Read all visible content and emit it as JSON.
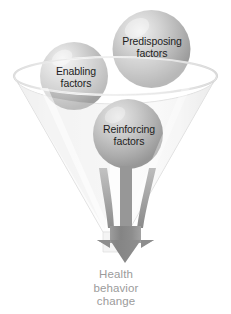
{
  "diagram": {
    "funnel": {
      "name": "funnel",
      "rim_label": "",
      "fill_color": "#f2f2f2",
      "outline_color": "#cfcfcf"
    },
    "spheres": [
      {
        "id": "predisposing",
        "label_line1": "Predisposing",
        "label_line2": "factors",
        "color": "#b9b9b9",
        "highlight_color": "#e8e8e8"
      },
      {
        "id": "enabling",
        "label_line1": "Enabling",
        "label_line2": "factors",
        "color": "#bdbdbd",
        "highlight_color": "#ececec"
      },
      {
        "id": "reinforcing",
        "label_line1": "Reinforcing",
        "label_line2": "factors",
        "color": "#b3b3b3",
        "highlight_color": "#e0e0e0"
      }
    ],
    "arrow": {
      "name": "down-arrow",
      "color": "#8a8a8a",
      "streams": 3
    },
    "outcome": {
      "line1": "Health",
      "line2": "behavior",
      "line3": "change",
      "color": "#9b9b9b"
    }
  }
}
